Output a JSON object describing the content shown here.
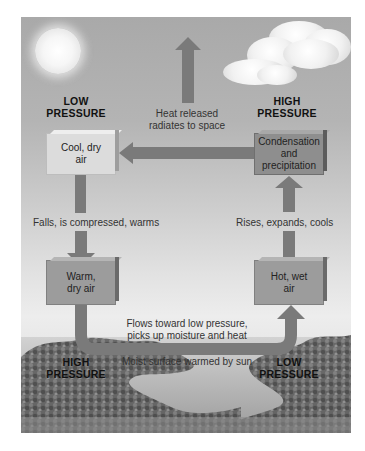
{
  "diagram": {
    "pressure_labels": {
      "top_left": [
        "LOW",
        "PRESSURE"
      ],
      "top_right": [
        "HIGH",
        "PRESSURE"
      ],
      "bottom_left": [
        "HIGH",
        "PRESSURE"
      ],
      "bottom_right": [
        "LOW",
        "PRESSURE"
      ]
    },
    "boxes": {
      "cool_dry_air": [
        "Cool, dry",
        "air"
      ],
      "condensation": [
        "Condensation",
        "and",
        "precipitation"
      ],
      "warm_dry_air": [
        "Warm,",
        "dry air"
      ],
      "hot_wet_air": [
        "Hot, wet",
        "air"
      ]
    },
    "captions": {
      "heat_released": [
        "Heat released",
        "radiates to space"
      ],
      "falls": "Falls, is compressed, warms",
      "rises": "Rises, expands, cools",
      "flows": [
        "Flows toward low pressure,",
        "picks up moisture and heat"
      ],
      "surface": "Moist surface warmed by sun"
    },
    "icons": {
      "sun": "sun-icon",
      "cloud": "cloud-icon",
      "landscape": "landscape-image"
    },
    "colors": {
      "arrow": "#7a7a7a",
      "sky": "#a9a9a9",
      "box_light": "#dcdcdc",
      "box_dark": "#8e8e8e"
    }
  }
}
